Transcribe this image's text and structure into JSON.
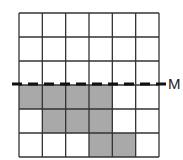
{
  "diagram": {
    "rows": 6,
    "cols": 6,
    "shaded_cells": [
      [
        3,
        0
      ],
      [
        3,
        1
      ],
      [
        3,
        2
      ],
      [
        3,
        3
      ],
      [
        4,
        1
      ],
      [
        4,
        2
      ],
      [
        4,
        3
      ],
      [
        5,
        3
      ],
      [
        5,
        4
      ]
    ],
    "shade_color": "#a9a9a9",
    "line_color": "#333333",
    "mirror_line": {
      "label": "M",
      "after_row": 3,
      "style": "dashed"
    }
  }
}
